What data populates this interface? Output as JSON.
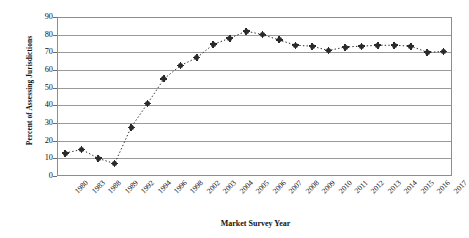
{
  "chart_data": {
    "type": "line",
    "title": "",
    "xlabel": "Market Survey Year",
    "ylabel": "Percent of Assessing Jurisdictions",
    "ylim": [
      0,
      90
    ],
    "yticks": [
      0,
      10,
      20,
      30,
      40,
      50,
      60,
      70,
      80,
      90
    ],
    "grid": true,
    "legend": null,
    "marker": "diamond",
    "linestyle": "dotted",
    "color": "#2a2a2a",
    "categories": [
      "1980",
      "1983",
      "1988",
      "1989",
      "1992",
      "1994",
      "1996",
      "1998",
      "2002",
      "2003",
      "2004",
      "2005",
      "2006",
      "2007",
      "2008",
      "2009",
      "2010",
      "2011",
      "2012",
      "2013",
      "2014",
      "2015",
      "2016",
      "2017"
    ],
    "values": [
      13,
      15,
      10,
      7,
      27.5,
      41,
      55,
      62.5,
      67,
      74.5,
      78,
      82,
      80,
      77,
      74,
      73.5,
      71,
      73,
      73.5,
      74,
      74,
      73.5,
      70,
      70.5
    ]
  }
}
